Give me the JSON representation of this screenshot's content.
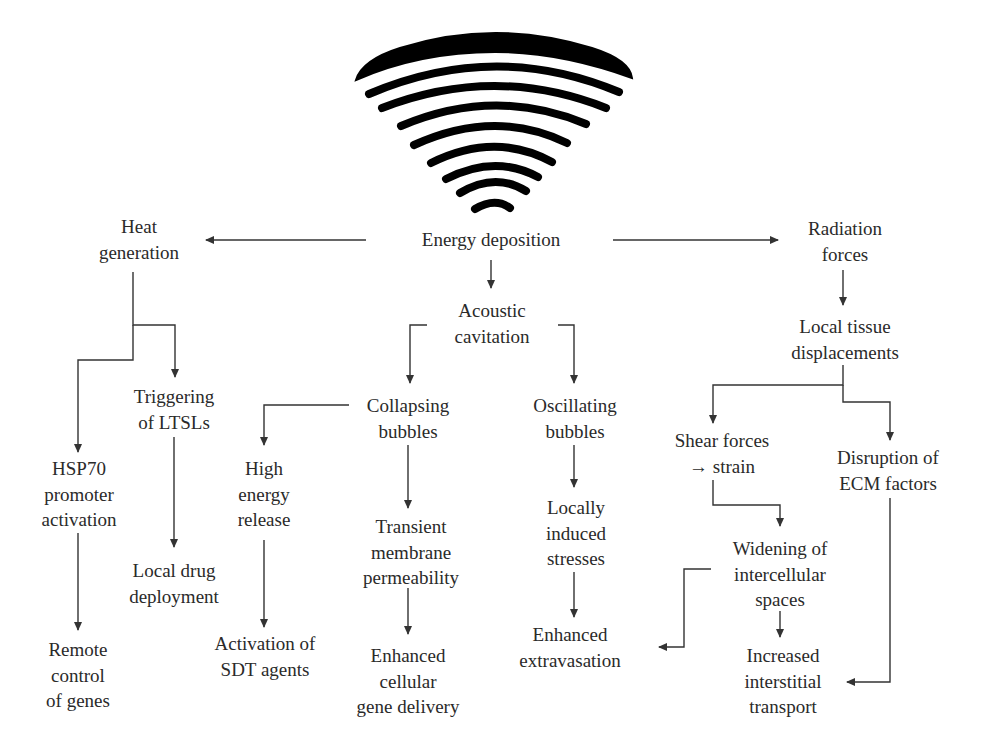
{
  "diagram": {
    "source_icon": "ultrasound-wave-icon",
    "colors": {
      "line": "#333333",
      "text": "#2a2a2a",
      "wave": "#000000",
      "background": "#ffffff"
    },
    "nodes": {
      "energy_deposition": {
        "lines": [
          "Energy deposition"
        ]
      },
      "heat_generation": {
        "lines": [
          "Heat",
          "generation"
        ]
      },
      "radiation_forces": {
        "lines": [
          "Radiation",
          "forces"
        ]
      },
      "acoustic_cavitation": {
        "lines": [
          "Acoustic",
          "cavitation"
        ]
      },
      "triggering_ltsls": {
        "lines": [
          "Triggering",
          "of LTSLs"
        ]
      },
      "hsp70": {
        "lines": [
          "HSP70",
          "promoter",
          "activation"
        ]
      },
      "local_drug": {
        "lines": [
          "Local drug",
          "deployment"
        ]
      },
      "remote_control": {
        "lines": [
          "Remote",
          "control",
          "of genes"
        ]
      },
      "collapsing_bubbles": {
        "lines": [
          "Collapsing",
          "bubbles"
        ]
      },
      "oscillating_bubbles": {
        "lines": [
          "Oscillating",
          "bubbles"
        ]
      },
      "high_energy": {
        "lines": [
          "High",
          "energy",
          "release"
        ]
      },
      "activation_sdt": {
        "lines": [
          "Activation of",
          "SDT agents"
        ]
      },
      "transient_membrane": {
        "lines": [
          "Transient",
          "membrane",
          "permeability"
        ]
      },
      "enhanced_gene": {
        "lines": [
          "Enhanced",
          "cellular",
          "gene delivery"
        ]
      },
      "locally_induced": {
        "lines": [
          "Locally",
          "induced",
          "stresses"
        ]
      },
      "enhanced_extravasation": {
        "lines": [
          "Enhanced",
          "extravasation"
        ]
      },
      "local_tissue": {
        "lines": [
          "Local tissue",
          "displacements"
        ]
      },
      "shear_forces": {
        "lines": [
          "Shear forces",
          "→ strain"
        ]
      },
      "disruption_ecm": {
        "lines": [
          "Disruption of",
          "ECM factors"
        ]
      },
      "widening": {
        "lines": [
          "Widening of",
          "intercellular",
          "spaces"
        ]
      },
      "increased_transport": {
        "lines": [
          "Increased",
          "interstitial",
          "transport"
        ]
      }
    },
    "edges": [
      [
        "energy_deposition",
        "heat_generation"
      ],
      [
        "energy_deposition",
        "radiation_forces"
      ],
      [
        "energy_deposition",
        "acoustic_cavitation"
      ],
      [
        "heat_generation",
        "triggering_ltsls"
      ],
      [
        "heat_generation",
        "hsp70"
      ],
      [
        "hsp70",
        "remote_control"
      ],
      [
        "triggering_ltsls",
        "local_drug"
      ],
      [
        "acoustic_cavitation",
        "collapsing_bubbles"
      ],
      [
        "acoustic_cavitation",
        "oscillating_bubbles"
      ],
      [
        "collapsing_bubbles",
        "high_energy"
      ],
      [
        "collapsing_bubbles",
        "transient_membrane"
      ],
      [
        "high_energy",
        "activation_sdt"
      ],
      [
        "transient_membrane",
        "enhanced_gene"
      ],
      [
        "oscillating_bubbles",
        "locally_induced"
      ],
      [
        "locally_induced",
        "enhanced_extravasation"
      ],
      [
        "radiation_forces",
        "local_tissue"
      ],
      [
        "local_tissue",
        "shear_forces"
      ],
      [
        "local_tissue",
        "disruption_ecm"
      ],
      [
        "shear_forces",
        "widening"
      ],
      [
        "widening",
        "enhanced_extravasation"
      ],
      [
        "widening",
        "increased_transport"
      ],
      [
        "disruption_ecm",
        "increased_transport"
      ]
    ]
  }
}
